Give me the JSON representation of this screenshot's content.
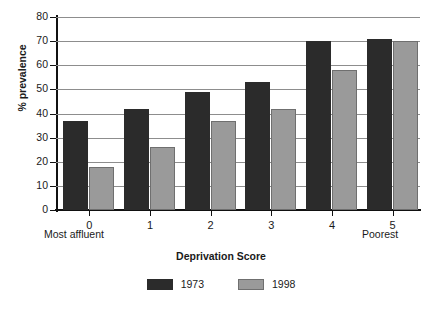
{
  "chart_data": {
    "type": "bar",
    "title": "",
    "xlabel": "Deprivation Score",
    "ylabel": "% prevalence",
    "categories": [
      "0",
      "1",
      "2",
      "3",
      "4",
      "5"
    ],
    "series": [
      {
        "name": "1973",
        "color": "#2b2b2b",
        "values": [
          37,
          42,
          49,
          53,
          70,
          71
        ]
      },
      {
        "name": "1998",
        "color": "#9a9a9a",
        "values": [
          18,
          26,
          37,
          42,
          58,
          70
        ]
      }
    ],
    "ylim": [
      0,
      80
    ],
    "ytick_labels": [
      "80",
      "70",
      "60",
      "50",
      "40",
      "30",
      "20",
      "10",
      "0"
    ],
    "ytick_values": [
      80,
      70,
      60,
      50,
      40,
      30,
      20,
      10,
      0
    ],
    "grid": "horizontal",
    "legend_position": "bottom-center",
    "annotations": {
      "left_end": "Most affluent",
      "right_end": "Poorest"
    }
  }
}
